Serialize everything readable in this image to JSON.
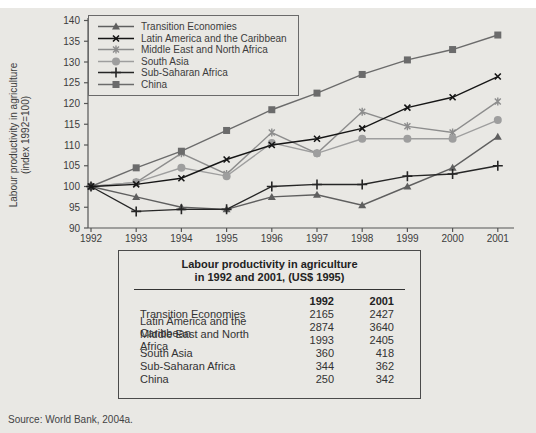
{
  "figure": {
    "y_axis_label_line1": "Labour productivity in agriculture",
    "y_axis_label_line2": "(index 1992=100)",
    "source": "Source: World Bank, 2004a."
  },
  "chart_data": {
    "type": "line",
    "x": [
      1992,
      1993,
      1994,
      1995,
      1996,
      1997,
      1998,
      1999,
      2000,
      2001
    ],
    "ylim": [
      90,
      140
    ],
    "ytick_step": 5,
    "ylabel": "Labour productivity in agriculture (index 1992=100)",
    "xlabel": "",
    "grid": false,
    "legend_position": "top-left",
    "series": [
      {
        "name": "Transition Economies",
        "marker": "triangle",
        "color": "#5f5f5f",
        "values": [
          100,
          97.5,
          95,
          94.5,
          97.5,
          98,
          95.5,
          100,
          104.5,
          112
        ]
      },
      {
        "name": "Latin America and the Caribbean",
        "marker": "x",
        "color": "#161616",
        "values": [
          100,
          100.5,
          102,
          106.5,
          110,
          111.5,
          114,
          119,
          121.5,
          126.5
        ]
      },
      {
        "name": "Middle East and North Africa",
        "marker": "asterisk",
        "color": "#8d8d8d",
        "values": [
          100,
          101,
          108,
          103,
          113,
          108,
          118,
          114.5,
          113,
          120.5
        ]
      },
      {
        "name": "South Asia",
        "marker": "circle",
        "color": "#9e9e9e",
        "values": [
          100,
          101,
          104.5,
          102.5,
          110.5,
          108,
          111.5,
          111.5,
          111.5,
          116
        ]
      },
      {
        "name": "Sub-Saharan Africa",
        "marker": "plus",
        "color": "#262626",
        "values": [
          100,
          94,
          94.5,
          94.5,
          100,
          100.5,
          100.5,
          102.5,
          103,
          105
        ]
      },
      {
        "name": "China",
        "marker": "square",
        "color": "#6b6b6b",
        "values": [
          100,
          104.5,
          108.5,
          113.5,
          118.5,
          122.5,
          127,
          130.5,
          133,
          136.5
        ]
      }
    ]
  },
  "table": {
    "title_line1": "Labour productivity in agriculture",
    "title_line2": "in 1992 and 2001, (US$ 1995)",
    "columns": [
      "1992",
      "2001"
    ],
    "rows": [
      {
        "label": "Transition Economies",
        "values": [
          "2165",
          "2427"
        ]
      },
      {
        "label": "Latin America and the Caribbean",
        "values": [
          "2874",
          "3640"
        ]
      },
      {
        "label": "Middle East and North Africa",
        "values": [
          "1993",
          "2405"
        ]
      },
      {
        "label": "South Asia",
        "values": [
          "360",
          "418"
        ]
      },
      {
        "label": "Sub-Saharan Africa",
        "values": [
          "344",
          "362"
        ]
      },
      {
        "label": "China",
        "values": [
          "250",
          "342"
        ]
      }
    ]
  }
}
